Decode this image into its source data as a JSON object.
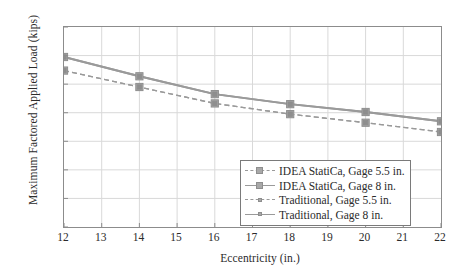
{
  "chart_data": {
    "type": "line",
    "title": "",
    "xlabel": "Eccentricity (in.)",
    "ylabel": "Maximum Factored Applied Load (kips)",
    "x": [
      12,
      14,
      16,
      18,
      20,
      22
    ],
    "xlim": [
      12,
      22
    ],
    "ylim": [
      0,
      280
    ],
    "xticks": [
      12,
      13,
      14,
      15,
      16,
      17,
      18,
      19,
      20,
      21,
      22
    ],
    "yticks": [
      0,
      40,
      80,
      120,
      160,
      200,
      240,
      280
    ],
    "grid": true,
    "legend_position": "lower right",
    "series": [
      {
        "name": "IDEA StatiCa, Gage 5.5 in.",
        "values": [
          219,
          196,
          173,
          158,
          146,
          133
        ],
        "style": "dashed",
        "marker": "square",
        "color": "#a8a8a8"
      },
      {
        "name": "IDEA StatiCa, Gage 8 in.",
        "values": [
          238,
          211,
          186,
          172,
          161,
          148
        ],
        "style": "solid",
        "marker": "square",
        "color": "#a8a8a8"
      },
      {
        "name": "Traditional, Gage 5.5 in.",
        "values": [
          219,
          196,
          173,
          158,
          146,
          133
        ],
        "style": "dashed",
        "marker": "square-small",
        "color": "#8e8e8e"
      },
      {
        "name": "Traditional, Gage 8 in.",
        "values": [
          238,
          211,
          186,
          172,
          161,
          148
        ],
        "style": "solid",
        "marker": "square-small",
        "color": "#8e8e8e"
      }
    ]
  },
  "legend": {
    "items": [
      {
        "label": "IDEA StatiCa, Gage 5.5 in."
      },
      {
        "label": "IDEA StatiCa, Gage 8 in."
      },
      {
        "label": "Traditional, Gage 5.5 in."
      },
      {
        "label": "Traditional, Gage 8 in."
      }
    ]
  },
  "colors": {
    "line": "#9a9a9a",
    "marker_fill": "#a8a8a8",
    "marker_edge": "#8e8e8e",
    "grid": "#d9d9d9",
    "frame": "#8c8c8c",
    "text": "#2b2b2b"
  }
}
